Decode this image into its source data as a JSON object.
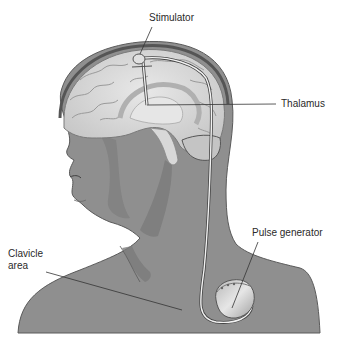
{
  "diagram": {
    "labels": {
      "stimulator": "Stimulator",
      "thalamus": "Thalamus",
      "pulse_generator": "Pulse generator",
      "clavicle_area": "Clavicle area"
    },
    "colors": {
      "skin": "#8f8f8f",
      "skin_shadow": "#7a7a7a",
      "skin_outline": "#5a5a5a",
      "brain": "#d4d4d4",
      "brain_highlight": "#ececec",
      "brain_fold": "#9a9a9a",
      "lead_wire": "#f2f2f2",
      "leader_line": "#333333",
      "text": "#2a2a2a"
    }
  }
}
